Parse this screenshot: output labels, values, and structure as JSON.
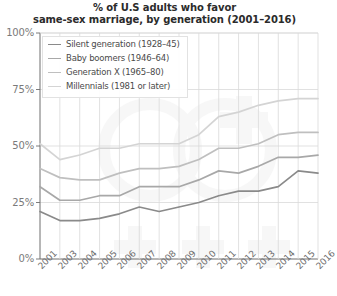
{
  "chart_data": {
    "type": "line",
    "title": "% of U.S adults who favor same-sex marriage, by generation (2001–2016)",
    "title_lines": [
      "% of U.S adults who favor",
      "same-sex marriage, by generation (2001–2016)"
    ],
    "xlabel": "",
    "ylabel": "",
    "ylim": [
      0,
      100
    ],
    "xlim": [
      2001,
      2016
    ],
    "grid": true,
    "legend_position": "top-left",
    "y_ticks": [
      "0%",
      "25%",
      "50%",
      "75%",
      "100%"
    ],
    "y_tick_values": [
      0,
      25,
      50,
      75,
      100
    ],
    "categories": [
      "2001",
      "2003",
      "2004",
      "2005",
      "2006",
      "2007",
      "2008",
      "2009",
      "2010",
      "2011",
      "2012",
      "2013",
      "2014",
      "2015",
      "2016"
    ],
    "series": [
      {
        "name": "Silent generation (1928–45)",
        "color": "#8a8a8a",
        "values": [
          21,
          17,
          17,
          18,
          20,
          23,
          21,
          23,
          25,
          28,
          30,
          30,
          32,
          39,
          38
        ]
      },
      {
        "name": "Baby boomers (1946–64)",
        "color": "#a8a8a8",
        "values": [
          32,
          26,
          26,
          28,
          28,
          32,
          32,
          32,
          35,
          39,
          38,
          41,
          45,
          45,
          46
        ]
      },
      {
        "name": "Generation X (1965–80)",
        "color": "#bfbfbf",
        "values": [
          40,
          36,
          35,
          35,
          38,
          40,
          40,
          41,
          44,
          49,
          49,
          51,
          55,
          56,
          56
        ]
      },
      {
        "name": "Millennials (1981 or later)",
        "color": "#d4d4d4",
        "values": [
          51,
          44,
          46,
          49,
          49,
          51,
          51,
          51,
          55,
          63,
          65,
          68,
          70,
          71,
          71
        ]
      }
    ]
  },
  "legend": {
    "items": [
      {
        "label": "Silent generation (1928–45)",
        "color": "#8a8a8a"
      },
      {
        "label": "Baby boomers (1946–64)",
        "color": "#a8a8a8"
      },
      {
        "label": "Generation X (1965–80)",
        "color": "#bfbfbf"
      },
      {
        "label": "Millennials (1981 or later)",
        "color": "#d4d4d4"
      }
    ]
  },
  "axes": {
    "grid_color": "#d9d9d9",
    "axis_color": "#6e6e6e",
    "tick_text_color": "#7a7a7a"
  }
}
